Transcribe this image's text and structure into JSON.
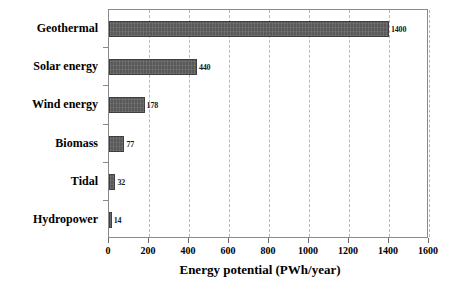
{
  "chart_data": {
    "type": "bar",
    "orientation": "horizontal",
    "title": "",
    "xlabel": "Energy potential (PWh/year)",
    "ylabel": "",
    "categories": [
      "Geothermal",
      "Solar energy",
      "Wind energy",
      "Biomass",
      "Tidal",
      "Hydropower"
    ],
    "values": [
      1400,
      440,
      178,
      77,
      32,
      14
    ],
    "data_labels": [
      "1400",
      "440",
      "178",
      "77",
      "32",
      "14"
    ],
    "xlim": [
      0,
      1600
    ],
    "xticks": [
      0,
      200,
      400,
      600,
      800,
      1000,
      1200,
      1400,
      1600
    ],
    "xticklabels": [
      "0",
      "200",
      "400",
      "600",
      "800",
      "1000",
      "1200",
      "1400",
      "1600"
    ],
    "grid": "vertical-dashed",
    "legend": "none",
    "bar_color": "#595959",
    "bar_edge_color": "#3f3f3f",
    "grid_color": "#b9b9b9",
    "axis_color": "#8a8a8a",
    "background": "#ffffff"
  }
}
